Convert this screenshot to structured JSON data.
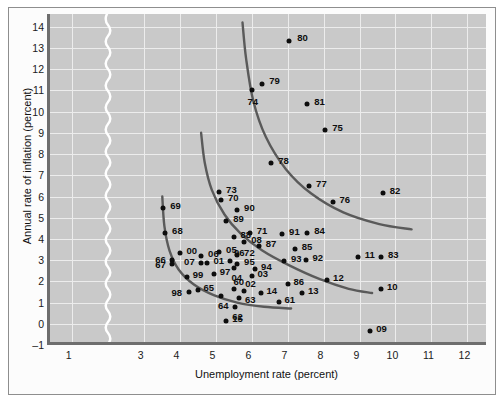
{
  "chart_data": {
    "type": "scatter",
    "title": "",
    "xlabel": "Unemployment rate (percent)",
    "ylabel": "Annual rate of inflation (percent)",
    "xlim": [
      0.4,
      12.6
    ],
    "ylim": [
      -1,
      14.6
    ],
    "xticks": [
      1,
      3,
      4,
      5,
      6,
      7,
      8,
      9,
      10,
      11,
      12
    ],
    "yticks": [
      -1,
      0,
      1,
      2,
      3,
      4,
      5,
      6,
      7,
      8,
      9,
      10,
      11,
      12,
      13,
      14
    ],
    "ytick_labels": [
      "–1",
      "0",
      "1",
      "2",
      "3",
      "4",
      "5",
      "6",
      "7",
      "8",
      "9",
      "10",
      "11",
      "12",
      "13",
      "14"
    ],
    "grid": true,
    "axis_break_after": 1,
    "point_color": "#0d0d0d",
    "curve_color": "#5a5a5a",
    "plot_background": "#c9c9c9",
    "grid_color": "#ececec",
    "points": [
      {
        "label": "80",
        "x": 7.05,
        "y": 13.35,
        "lx": 8,
        "ly": -4
      },
      {
        "label": "79",
        "x": 6.3,
        "y": 11.3,
        "lx": 7,
        "ly": -4
      },
      {
        "label": "74",
        "x": 6.0,
        "y": 11.0,
        "lx": -4,
        "ly": 11
      },
      {
        "label": "81",
        "x": 7.55,
        "y": 10.35,
        "lx": 7,
        "ly": -3
      },
      {
        "label": "75",
        "x": 8.05,
        "y": 9.15,
        "lx": 7,
        "ly": -3
      },
      {
        "label": "78",
        "x": 6.55,
        "y": 7.6,
        "lx": 7,
        "ly": -3
      },
      {
        "label": "77",
        "x": 7.6,
        "y": 6.5,
        "lx": 7,
        "ly": -3
      },
      {
        "label": "82",
        "x": 9.65,
        "y": 6.15,
        "lx": 7,
        "ly": -3
      },
      {
        "label": "76",
        "x": 8.25,
        "y": 5.75,
        "lx": 7,
        "ly": -3
      },
      {
        "label": "73",
        "x": 5.1,
        "y": 6.2,
        "lx": 7,
        "ly": -3
      },
      {
        "label": "70",
        "x": 5.15,
        "y": 5.85,
        "lx": 7,
        "ly": -3
      },
      {
        "label": "69",
        "x": 3.55,
        "y": 5.45,
        "lx": 7,
        "ly": -3
      },
      {
        "label": "90",
        "x": 5.6,
        "y": 5.35,
        "lx": 7,
        "ly": -3
      },
      {
        "label": "89",
        "x": 5.3,
        "y": 4.85,
        "lx": 7,
        "ly": -3
      },
      {
        "label": "68",
        "x": 3.6,
        "y": 4.3,
        "lx": 7,
        "ly": -3
      },
      {
        "label": "71",
        "x": 5.95,
        "y": 4.3,
        "lx": 7,
        "ly": -3
      },
      {
        "label": "84",
        "x": 7.55,
        "y": 4.3,
        "lx": 7,
        "ly": -3
      },
      {
        "label": "91",
        "x": 6.85,
        "y": 4.25,
        "lx": 7,
        "ly": -3
      },
      {
        "label": "88",
        "x": 5.5,
        "y": 4.1,
        "lx": 7,
        "ly": -3
      },
      {
        "label": "08",
        "x": 5.8,
        "y": 3.85,
        "lx": 7,
        "ly": -3
      },
      {
        "label": "87",
        "x": 6.2,
        "y": 3.65,
        "lx": 7,
        "ly": -3
      },
      {
        "label": "85",
        "x": 7.2,
        "y": 3.55,
        "lx": 7,
        "ly": -3
      },
      {
        "label": "05",
        "x": 5.1,
        "y": 3.4,
        "lx": 7,
        "ly": -3
      },
      {
        "label": "72",
        "x": 5.6,
        "y": 3.25,
        "lx": 7,
        "ly": -3
      },
      {
        "label": "00",
        "x": 4.0,
        "y": 3.35,
        "lx": 7,
        "ly": -3
      },
      {
        "label": "93",
        "x": 6.9,
        "y": 2.95,
        "lx": 7,
        "ly": -3
      },
      {
        "label": "92",
        "x": 7.5,
        "y": 3.0,
        "lx": 7,
        "ly": -3
      },
      {
        "label": "11",
        "x": 8.95,
        "y": 3.15,
        "lx": 7,
        "ly": -3
      },
      {
        "label": "83",
        "x": 9.6,
        "y": 3.15,
        "lx": 7,
        "ly": -3
      },
      {
        "label": "96",
        "x": 5.4,
        "y": 2.95,
        "lx": 4,
        "ly": -9
      },
      {
        "label": "66",
        "x": 3.8,
        "y": 3.0,
        "lx": -17,
        "ly": -1
      },
      {
        "label": "06",
        "x": 4.6,
        "y": 3.2,
        "lx": 7,
        "ly": -3
      },
      {
        "label": "95",
        "x": 5.6,
        "y": 2.8,
        "lx": 7,
        "ly": -3
      },
      {
        "label": "01",
        "x": 4.75,
        "y": 2.85,
        "lx": 7,
        "ly": -3
      },
      {
        "label": "07",
        "x": 4.6,
        "y": 2.85,
        "lx": -17,
        "ly": -2
      },
      {
        "label": "67",
        "x": 3.8,
        "y": 2.8,
        "lx": -17,
        "ly": 0
      },
      {
        "label": "94",
        "x": 6.1,
        "y": 2.6,
        "lx": 6,
        "ly": -3
      },
      {
        "label": "97",
        "x": 4.95,
        "y": 2.35,
        "lx": 6,
        "ly": -3
      },
      {
        "label": "04",
        "x": 5.5,
        "y": 2.65,
        "lx": -2,
        "ly": 9
      },
      {
        "label": "99",
        "x": 4.2,
        "y": 2.2,
        "lx": 6,
        "ly": -3
      },
      {
        "label": "03",
        "x": 6.0,
        "y": 2.25,
        "lx": 6,
        "ly": -3
      },
      {
        "label": "12",
        "x": 8.1,
        "y": 2.05,
        "lx": 6,
        "ly": -3
      },
      {
        "label": "86",
        "x": 7.0,
        "y": 1.9,
        "lx": 6,
        "ly": -3
      },
      {
        "label": "13",
        "x": 7.4,
        "y": 1.45,
        "lx": 6,
        "ly": -3
      },
      {
        "label": "10",
        "x": 9.6,
        "y": 1.65,
        "lx": 6,
        "ly": -3
      },
      {
        "label": "65",
        "x": 4.5,
        "y": 1.6,
        "lx": 6,
        "ly": -3
      },
      {
        "label": "60",
        "x": 5.5,
        "y": 1.65,
        "lx": 0,
        "ly": -8
      },
      {
        "label": "02",
        "x": 5.8,
        "y": 1.55,
        "lx": 1,
        "ly": -8
      },
      {
        "label": "14",
        "x": 6.25,
        "y": 1.45,
        "lx": 6,
        "ly": -3
      },
      {
        "label": "98",
        "x": 4.25,
        "y": 1.5,
        "lx": -17,
        "ly": 0
      },
      {
        "label": "64",
        "x": 5.15,
        "y": 1.3,
        "lx": -3,
        "ly": 9
      },
      {
        "label": "63",
        "x": 5.65,
        "y": 1.2,
        "lx": 6,
        "ly": 1
      },
      {
        "label": "61",
        "x": 6.75,
        "y": 1.05,
        "lx": 6,
        "ly": -3
      },
      {
        "label": "62",
        "x": 5.55,
        "y": 0.8,
        "lx": -3,
        "ly": 9
      },
      {
        "label": "15",
        "x": 5.3,
        "y": 0.15,
        "lx": 6,
        "ly": -3
      },
      {
        "label": "09",
        "x": 9.3,
        "y": -0.35,
        "lx": 6,
        "ly": -3
      }
    ],
    "curves": [
      {
        "name": "long-run-1970s-curve",
        "points": [
          [
            5.75,
            14.2
          ],
          [
            5.85,
            12.5
          ],
          [
            6.05,
            10.5
          ],
          [
            6.4,
            8.8
          ],
          [
            6.95,
            7.3
          ],
          [
            7.65,
            6.15
          ],
          [
            8.55,
            5.25
          ],
          [
            9.55,
            4.7
          ],
          [
            10.45,
            4.45
          ]
        ]
      },
      {
        "name": "mid-1970s-curve",
        "points": [
          [
            4.6,
            9.0
          ],
          [
            4.7,
            7.6
          ],
          [
            4.9,
            6.3
          ],
          [
            5.25,
            5.15
          ],
          [
            5.7,
            4.25
          ],
          [
            6.3,
            3.45
          ],
          [
            7.05,
            2.75
          ],
          [
            7.9,
            2.1
          ],
          [
            8.7,
            1.65
          ],
          [
            9.35,
            1.45
          ]
        ]
      },
      {
        "name": "early-postwar-curve",
        "points": [
          [
            3.52,
            6.0
          ],
          [
            3.58,
            4.6
          ],
          [
            3.72,
            3.45
          ],
          [
            3.98,
            2.55
          ],
          [
            4.4,
            1.85
          ],
          [
            4.95,
            1.35
          ],
          [
            5.6,
            1.0
          ],
          [
            6.35,
            0.8
          ],
          [
            7.1,
            0.72
          ]
        ]
      }
    ]
  }
}
